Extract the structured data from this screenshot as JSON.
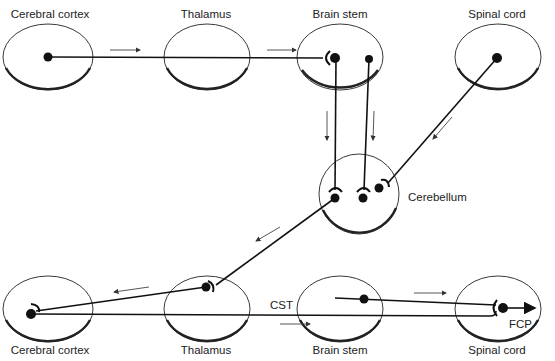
{
  "diagram": {
    "top_row": {
      "nodes": [
        {
          "id": "cc-top",
          "label": "Cerebral cortex"
        },
        {
          "id": "thal-top",
          "label": "Thalamus"
        },
        {
          "id": "bs-top",
          "label": "Brain stem"
        },
        {
          "id": "sc-top",
          "label": "Spinal cord"
        }
      ]
    },
    "middle": {
      "node": {
        "id": "cerebellum",
        "label": "Cerebellum"
      }
    },
    "bottom_row": {
      "nodes": [
        {
          "id": "cc-bottom",
          "label": "Cerebral cortex"
        },
        {
          "id": "thal-bottom",
          "label": "Thalamus"
        },
        {
          "id": "bs-bottom",
          "label": "Brain stem"
        },
        {
          "id": "sc-bottom",
          "label": "Spinal cord"
        }
      ]
    },
    "pathway_labels": {
      "cst": "CST",
      "fcp": "FCP"
    },
    "colors": {
      "line": "#111111",
      "ellipse": "#222222",
      "background": "#ffffff"
    }
  }
}
